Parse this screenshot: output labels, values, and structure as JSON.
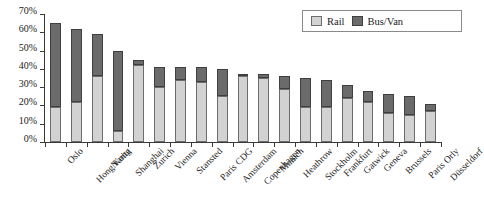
{
  "chart_data": {
    "type": "bar",
    "subtype": "stacked-vertical",
    "title": "",
    "xlabel": "",
    "ylabel": "",
    "ylim": [
      0,
      70
    ],
    "ytick_labels": [
      "0%",
      "10%",
      "20%",
      "30%",
      "40%",
      "50%",
      "60%",
      "70%"
    ],
    "ytick_values": [
      0,
      10,
      20,
      30,
      40,
      50,
      60,
      70
    ],
    "grid": false,
    "legend_position": "top-right",
    "categories": [
      "Oslo",
      "Hong Kong",
      "Narita",
      "Shanghai",
      "Zurich",
      "Vienna",
      "Stansted",
      "Paris CDG",
      "Amsterdam",
      "Copenhagen",
      "Munich",
      "Heathrow",
      "Stockholm",
      "Frankfurt",
      "Gatwick",
      "Geneva",
      "Brussels",
      "Paris Orly",
      "Düsseldorf"
    ],
    "series": [
      {
        "name": "Rail",
        "color": "#d2d2d2",
        "values": [
          19,
          22,
          36,
          6,
          42,
          30,
          34,
          33,
          25,
          36,
          35,
          29,
          19,
          19,
          24,
          22,
          16,
          15,
          17
        ]
      },
      {
        "name": "Bus/Van",
        "color": "#6b6b6b",
        "values": [
          46,
          40,
          23,
          44,
          3,
          11,
          7,
          8,
          15,
          1,
          2,
          7,
          16,
          15,
          7,
          6,
          10,
          10,
          4
        ]
      }
    ],
    "totals": [
      65,
      62,
      59,
      50,
      45,
      41,
      41,
      41,
      40,
      37,
      37,
      36,
      35,
      34,
      31,
      28,
      26,
      25,
      21
    ]
  },
  "legend": {
    "items": [
      {
        "label": "Rail",
        "swatch": "rail-swatch-icon"
      },
      {
        "label": "Bus/Van",
        "swatch": "bus-van-swatch-icon"
      }
    ]
  }
}
